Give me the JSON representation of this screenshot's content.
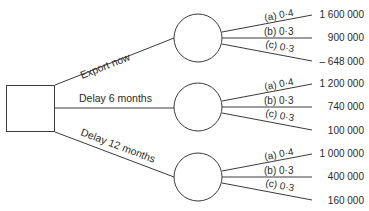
{
  "diagram": {
    "type": "decision-tree",
    "decision_node": {
      "shape": "square"
    },
    "options": [
      {
        "label": "Export now",
        "outcomes": [
          {
            "prob_label": "(a) 0·4",
            "value": "1 600 000"
          },
          {
            "prob_label": "(b) 0·3",
            "value": "900 000"
          },
          {
            "prob_label": "(c) 0·3",
            "value": "– 648 000"
          }
        ]
      },
      {
        "label": "Delay 6 months",
        "outcomes": [
          {
            "prob_label": "(a) 0·4",
            "value": "1 200 000"
          },
          {
            "prob_label": "(b) 0·3",
            "value": "740 000"
          },
          {
            "prob_label": "(c) 0·3",
            "value": "100 000"
          }
        ]
      },
      {
        "label": "Delay 12 months",
        "outcomes": [
          {
            "prob_label": "(a) 0·4",
            "value": "1 000 000"
          },
          {
            "prob_label": "(b) 0·3",
            "value": "400 000"
          },
          {
            "prob_label": "(c) 0·3",
            "value": "160 000"
          }
        ]
      }
    ]
  }
}
